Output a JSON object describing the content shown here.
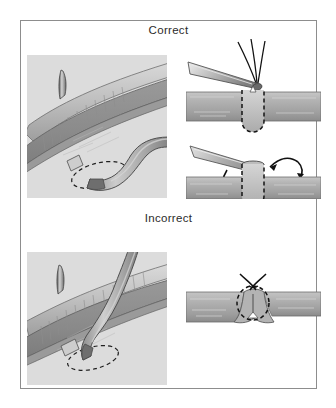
{
  "figure": {
    "title_correct": "Correct",
    "title_incorrect": "Incorrect",
    "frame_color": "#8d8d8d",
    "background_color": "#ffffff",
    "panel_background_color": "#dcdcdc",
    "vessel_fill_color": "#a9a9a9",
    "vessel_dark_color": "#8a8a8a",
    "vessel_light_color": "#cfcfcf",
    "graft_fill_color": "#b4b4b4",
    "outline_color": "#3a3a3a",
    "dashed_color": "#1f1f1f",
    "instrument_color": "#b8b8b8",
    "suture_color": "#1a1a1a"
  },
  "panels": {
    "correct_left": {
      "name": "Correct — oblique anastomosis, side view",
      "elements": {
        "needle": "curved-suture-needle",
        "host_vessel": "recipient-artery",
        "graft_vessel": "bypass-graft",
        "anastomosis_outline": "dashed-elliptical-anastomosis-opening",
        "cuff_band": "graft-cuff-band"
      }
    },
    "correct_right_top": {
      "name": "Correct — forceps holding suture at anastomosis",
      "elements": {
        "forceps": "needle-holder-forceps",
        "sutures": "three-suture-strands",
        "vessel": "horizontal-vessel-wall",
        "dashed_region": "dashed-anastomosis-window"
      }
    },
    "correct_right_bottom": {
      "name": "Correct — graft rotation into position",
      "elements": {
        "instrument": "flat-dissector-blade",
        "arrow_down": "downward-curved-arrow",
        "arrow_up": "upward-curved-arrow",
        "vessel": "horizontal-vessel-wall",
        "dashed_region": "dashed-anastomosis-window"
      }
    },
    "incorrect_left": {
      "name": "Incorrect — graft crossing at steep angle",
      "elements": {
        "needle": "curved-suture-needle",
        "host_vessel": "recipient-artery",
        "graft_vessel": "bypass-graft-crossing-over",
        "anastomosis_outline": "dashed-elliptical-anastomosis-opening",
        "cuff_band": "graft-cuff-band"
      }
    },
    "incorrect_right": {
      "name": "Incorrect — purse-stringed constricted anastomosis",
      "elements": {
        "vessel": "horizontal-vessel-wall",
        "dashed_region": "dashed-constricted-opening",
        "suture_ends": "crossed-suture-tails",
        "pucker": "puckered-stenotic-junction"
      }
    }
  }
}
